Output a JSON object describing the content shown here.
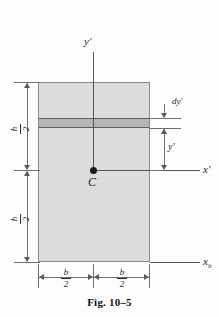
{
  "figure": {
    "caption": "Fig. 10–5",
    "shape": "rectangular-cross-section",
    "fill_color": "#dddddd",
    "strip_color": "#b6b6b6",
    "outline_color": "#8a8a8a"
  },
  "axes": {
    "vertical": {
      "label": "y'",
      "name": "y-prime-axis"
    },
    "horizontal_centroidal": {
      "label": "x'",
      "name": "x-prime-axis"
    },
    "horizontal_base": {
      "label": "x",
      "subscript": "b",
      "name": "x-b-axis"
    }
  },
  "points": {
    "centroid": {
      "label": "C"
    }
  },
  "dimensions": {
    "height_upper": {
      "numerator": "h",
      "denominator": "2"
    },
    "height_lower": {
      "numerator": "h",
      "denominator": "2"
    },
    "width_left": {
      "numerator": "b",
      "denominator": "2"
    },
    "width_right": {
      "numerator": "b",
      "denominator": "2"
    },
    "strip_thickness": {
      "label": "dy'"
    },
    "strip_position": {
      "label": "y'"
    }
  }
}
